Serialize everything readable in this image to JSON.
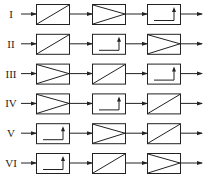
{
  "diagram": {
    "type": "block-diagram",
    "stroke_color": "#222222",
    "rows": [
      {
        "label": "I",
        "blocks": [
          "converter",
          "amplifier",
          "step"
        ]
      },
      {
        "label": "II",
        "blocks": [
          "converter",
          "step",
          "amplifier"
        ]
      },
      {
        "label": "III",
        "blocks": [
          "amplifier",
          "converter",
          "step"
        ]
      },
      {
        "label": "IV",
        "blocks": [
          "amplifier",
          "step",
          "converter"
        ]
      },
      {
        "label": "V",
        "blocks": [
          "step",
          "amplifier",
          "converter"
        ]
      },
      {
        "label": "VI",
        "blocks": [
          "step",
          "converter",
          "amplifier"
        ]
      }
    ],
    "block_legend": {
      "converter": "diagonal-line-block",
      "amplifier": "triangle-block",
      "step": "step-arrow-block"
    }
  }
}
